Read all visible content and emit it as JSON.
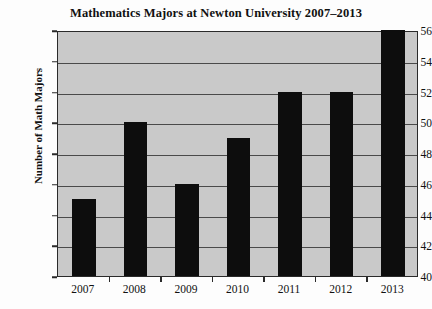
{
  "chart_data": {
    "type": "bar",
    "title": "Mathematics Majors at Newton University 2007–2013",
    "xlabel": "",
    "ylabel": "Number of Math Majors",
    "categories": [
      "2007",
      "2008",
      "2009",
      "2010",
      "2011",
      "2012",
      "2013"
    ],
    "values": [
      45,
      50,
      46,
      49,
      52,
      52,
      56
    ],
    "ylim": [
      40,
      56
    ],
    "ytick_step": 2,
    "yticks": [
      40,
      42,
      44,
      46,
      48,
      50,
      52,
      54,
      56
    ],
    "ytick_labels": [
      "40",
      "42",
      "44",
      "46",
      "48",
      "50",
      "52",
      "54",
      "56"
    ],
    "gridlines": [
      42,
      44,
      46,
      48,
      50,
      52,
      54
    ],
    "grid": true,
    "legend": false,
    "legend_position": "none",
    "series": [
      {
        "name": "Number of Math Majors",
        "values": [
          45,
          50,
          46,
          49,
          52,
          52,
          56
        ]
      }
    ],
    "colors": {
      "bar": "#0d0d0d",
      "plot_background": "#c9c9c9",
      "page_background": "#fdfdfd",
      "axis": "#2a2a2a",
      "gridline": "#4a4a4a",
      "text": "#111111"
    }
  }
}
